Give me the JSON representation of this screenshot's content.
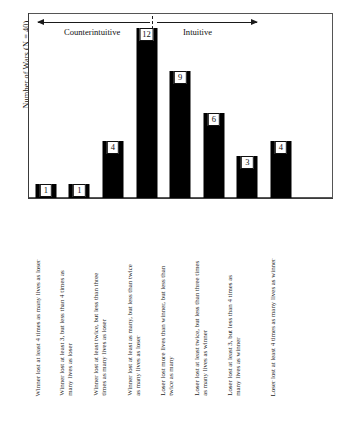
{
  "chart_data": {
    "type": "bar",
    "title": "",
    "subtitle": "",
    "xlabel": "",
    "ylabel": "Number of Wars (N = 40)",
    "ylim": [
      0,
      13
    ],
    "grid": false,
    "legend_position": "none",
    "bar_color": "#000000",
    "categories": [
      "Winner lost at least 4 times as many lives as loser",
      "Winner lost at least 3, but less than 4 times as\nmany lives as loser",
      "Winner lost at least twice, but less than three\ntimes as many lives as loser",
      "Winner lost at least as many, but less than twice\nas many lives as loser",
      "Loser lost more lives than winner, but less than\ntwice as many",
      "Loser lost at least twice, but less than three times\nas many lives as winner",
      "Loser lost at least 3, but less than 4 times as\nmany lives as winner",
      "Loser lost at least 4 times as many lives as winner"
    ],
    "values": [
      1,
      1,
      4,
      12,
      9,
      6,
      3,
      4
    ],
    "value_labels": [
      "1",
      "1",
      "4",
      "12",
      "9",
      "6",
      "3",
      "4"
    ],
    "annotations": {
      "left_region": "Counterintuitive",
      "right_region": "Intuitive",
      "divider": "dashed-vertical-line"
    }
  },
  "caption": {
    "text": ""
  }
}
